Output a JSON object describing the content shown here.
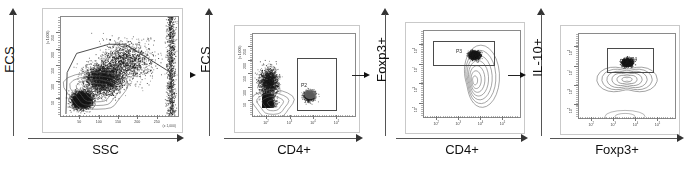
{
  "figure": {
    "name": "flow-cytometry-gating-strategy",
    "panel_count": 4,
    "connector_label": "arrow-right"
  },
  "chart_data": [
    {
      "type": "scatter",
      "id": "panel-1",
      "title": "",
      "xlabel": "SSC",
      "ylabel": "FCS",
      "xscale": "linear",
      "yscale": "linear",
      "x_unit": "(x 1,000)",
      "y_unit": "(x 1,000)",
      "xticks": [
        "50",
        "100",
        "150",
        "200",
        "250"
      ],
      "yticks": [
        "50",
        "100",
        "150",
        "200",
        "250"
      ],
      "xlim": [
        0,
        262
      ],
      "ylim": [
        0,
        262
      ],
      "grid": false,
      "legend": "none",
      "gate": {
        "label": "",
        "shape": "polygon",
        "points": "lymphocyte-gate"
      },
      "annotation": "ungated events, lymphocyte polygon gate drawn"
    },
    {
      "type": "scatter",
      "id": "panel-2",
      "title": "",
      "xlabel": "CD4+",
      "ylabel": "FCS",
      "xscale": "log",
      "yscale": "linear",
      "y_unit": "(x 1,000)",
      "xticks": [
        "10²",
        "10³",
        "10⁴",
        "10⁵"
      ],
      "yticks": [
        "50",
        "100",
        "150",
        "200",
        "250"
      ],
      "grid": false,
      "legend": "none",
      "gate": {
        "label": "P2",
        "shape": "rectangle"
      },
      "annotation": "CD4+ positive population gated as P2"
    },
    {
      "type": "scatter",
      "id": "panel-3",
      "title": "",
      "xlabel": "CD4+",
      "ylabel": "Foxp3+",
      "xscale": "log",
      "yscale": "log",
      "xticks": [
        "10²",
        "10³",
        "10⁴",
        "10⁵"
      ],
      "yticks": [
        "10²",
        "10³",
        "10⁴",
        "10⁵"
      ],
      "grid": false,
      "legend": "none",
      "gate": {
        "label": "P3",
        "shape": "rectangle"
      },
      "annotation": "Foxp3+ CD4+ population gated as P3"
    },
    {
      "type": "scatter",
      "id": "panel-4",
      "title": "",
      "xlabel": "Foxp3+",
      "ylabel": "IL-10+",
      "xscale": "log",
      "yscale": "log",
      "xticks": [
        "10²",
        "10³",
        "10⁴",
        "10⁵"
      ],
      "yticks": [
        "10²",
        "10³",
        "10⁴",
        "10⁵"
      ],
      "grid": false,
      "legend": "none",
      "gate": {
        "label": "P4",
        "shape": "rectangle"
      },
      "annotation": "IL-10+ Foxp3+ population gated as P4"
    }
  ],
  "panels": [
    {
      "xlabel": "SSC",
      "ylabel": "FCS",
      "gate_label": ""
    },
    {
      "xlabel": "CD4+",
      "ylabel": "FCS",
      "gate_label": "P2"
    },
    {
      "xlabel": "CD4+",
      "ylabel": "Foxp3+",
      "gate_label": "P3"
    },
    {
      "xlabel": "Foxp3+",
      "ylabel": "IL-10+",
      "gate_label": "P4"
    }
  ],
  "units": {
    "thousand": "(x 1,000)"
  },
  "linear_ticks": [
    "50",
    "100",
    "150",
    "200",
    "250"
  ],
  "log_ticks": [
    "2",
    "3",
    "4",
    "5"
  ],
  "colors": {
    "axis": "#555555",
    "frame": "#8a8a8a",
    "gate": "#4a4a4a",
    "text": "#111111",
    "events": "#222222"
  }
}
